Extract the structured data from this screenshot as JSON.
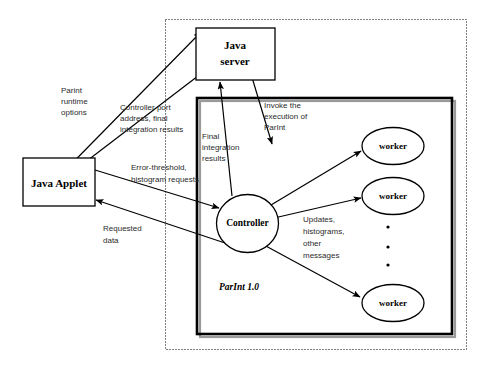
{
  "diagram": {
    "system_label": "ParInt 1.0",
    "nodes": {
      "applet": {
        "label_line1": "Java Applet"
      },
      "server": {
        "label_line1": "Java",
        "label_line2": "server"
      },
      "controller": {
        "label": "Controller"
      },
      "worker1": {
        "label": "worker"
      },
      "worker2": {
        "label": "worker"
      },
      "worker3": {
        "label": "worker"
      }
    },
    "edges": {
      "runtime_options": {
        "line1": "Parint",
        "line2": "runtime",
        "line3": "options"
      },
      "controller_port": {
        "line1": "Controller port",
        "line2": "address, final",
        "line3": "integration results"
      },
      "error_threshold": {
        "line1": "Error-threshold,",
        "line2": "histogram requests"
      },
      "requested_data": {
        "line1": "Requested",
        "line2": "data"
      },
      "final_integration": {
        "line1": "Final",
        "line2": "integration",
        "line3": "results"
      },
      "invoke_execution": {
        "line1": "Invoke the",
        "line2": "execution of",
        "line3": "ParInt"
      },
      "updates": {
        "line1": "Updates,",
        "line2": "histograms,",
        "line3": "other",
        "line4": "messages"
      }
    },
    "ellipsis": {
      "dot1": "•",
      "dot2": "•",
      "dot3": "•"
    },
    "colors": {
      "stroke": "#000000",
      "background": "#ffffff",
      "shadow": "#9a9a9a",
      "label_text": "#2b2b2b"
    }
  }
}
